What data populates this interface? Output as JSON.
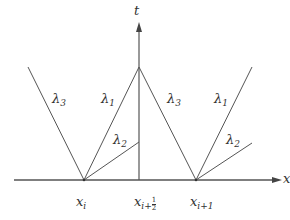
{
  "diagram": {
    "axes": {
      "x_label": "x",
      "t_label": "t"
    },
    "colors": {
      "line": "#555555",
      "text": "#333333",
      "background": "#ffffff"
    },
    "ticks": [
      {
        "id": "x_i",
        "base": "x",
        "sub": "i"
      },
      {
        "id": "x_i_half",
        "base": "x",
        "sub": "i+",
        "frac_num": "1",
        "frac_den": "2"
      },
      {
        "id": "x_i_plus_1",
        "base": "x",
        "sub": "i+1"
      }
    ],
    "wave_labels": {
      "left_lambda3": {
        "base": "λ",
        "sub": "3"
      },
      "left_lambda1": {
        "base": "λ",
        "sub": "1"
      },
      "left_lambda2": {
        "base": "λ",
        "sub": "2"
      },
      "right_lambda3": {
        "base": "λ",
        "sub": "3"
      },
      "right_lambda1": {
        "base": "λ",
        "sub": "1"
      },
      "right_lambda2": {
        "base": "λ",
        "sub": "2"
      }
    },
    "lines": [
      {
        "name": "x-axis",
        "from": [
          14,
          180
        ],
        "to": [
          278,
          180
        ]
      },
      {
        "name": "t-axis",
        "from": [
          139,
          180
        ],
        "to": [
          139,
          26
        ]
      },
      {
        "name": "lambda3-left-wave",
        "from": [
          84,
          180
        ],
        "to": [
          28,
          67
        ]
      },
      {
        "name": "lambda1-from-xi",
        "from": [
          84,
          180
        ],
        "to": [
          139,
          67
        ]
      },
      {
        "name": "lambda2-from-xi",
        "from": [
          84,
          180
        ],
        "to": [
          139,
          142
        ]
      },
      {
        "name": "lambda3-to-xi1",
        "from": [
          139,
          67
        ],
        "to": [
          196,
          180
        ]
      },
      {
        "name": "lambda1-from-xi1",
        "from": [
          196,
          180
        ],
        "to": [
          252,
          67
        ]
      },
      {
        "name": "lambda2-from-xi1",
        "from": [
          196,
          180
        ],
        "to": [
          252,
          143
        ]
      }
    ]
  }
}
